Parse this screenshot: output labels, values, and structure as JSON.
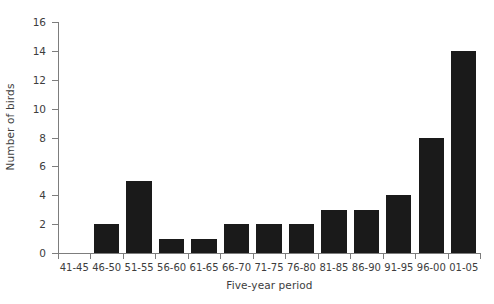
{
  "chart_data": {
    "type": "bar",
    "title": "",
    "xlabel": "Five-year period",
    "ylabel": "Number of birds",
    "categories": [
      "41-45",
      "46-50",
      "51-55",
      "56-60",
      "61-65",
      "66-70",
      "71-75",
      "76-80",
      "81-85",
      "86-90",
      "91-95",
      "96-00",
      "01-05"
    ],
    "values": [
      0,
      2,
      5,
      1,
      1,
      2,
      2,
      2,
      3,
      3,
      4,
      8,
      14
    ],
    "ylim": [
      0,
      16
    ],
    "ytick_labels": [
      "0",
      "2",
      "4",
      "6",
      "8",
      "10",
      "12",
      "14",
      "16"
    ],
    "ytick_values": [
      0,
      2,
      4,
      6,
      8,
      10,
      12,
      14,
      16
    ],
    "grid": false,
    "legend": "none",
    "bar_color": "#1a1a1a",
    "axis_color": "#7d7d7d",
    "text_color": "#3d3d3d",
    "background_color": "#ffffff"
  }
}
